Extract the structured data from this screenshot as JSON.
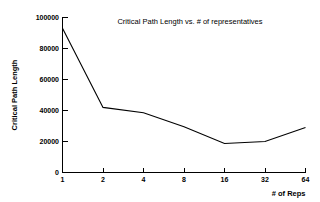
{
  "chart_data": {
    "type": "line",
    "title": "Critical Path Length vs. # of representatives",
    "xlabel": "# of Reps",
    "ylabel": "Critical Path Length",
    "x_scale": "log2",
    "categories": [
      "1",
      "2",
      "4",
      "8",
      "16",
      "32",
      "64"
    ],
    "x": [
      1,
      2,
      4,
      8,
      16,
      32,
      64
    ],
    "values": [
      93000,
      42000,
      38500,
      29500,
      18700,
      20000,
      29000
    ],
    "series": [
      {
        "name": "Critical Path Length",
        "values": [
          93000,
          42000,
          38500,
          29500,
          18700,
          20000,
          29000
        ]
      }
    ],
    "xlim": [
      1,
      64
    ],
    "ylim": [
      0,
      100000
    ],
    "ytick_labels": [
      "0",
      "20000",
      "40000",
      "60000",
      "80000",
      "100000"
    ],
    "ytick_values": [
      0,
      20000,
      40000,
      60000,
      80000,
      100000
    ],
    "xtick_labels": [
      "1",
      "2",
      "4",
      "8",
      "16",
      "32",
      "64"
    ],
    "grid": false,
    "legend": "none",
    "title_position": "inside-top-right",
    "line_color": "#000000",
    "background_color": "#ffffff",
    "markers": false
  }
}
